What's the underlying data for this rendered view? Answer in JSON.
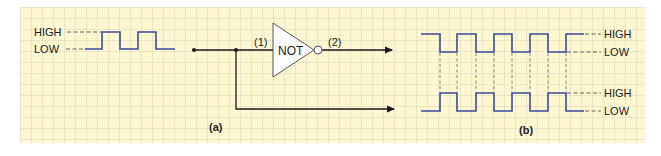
{
  "figure": {
    "colors": {
      "paper": "#fdf8d2",
      "grid": "#c9c6b4",
      "wave": "#3c4a9a",
      "wire": "#1a1a1a",
      "text": "#222222"
    },
    "grid": {
      "x0": 20,
      "y0": 7,
      "x1": 645,
      "y1": 143,
      "step": 11
    }
  },
  "panel_a": {
    "caption": "(a)",
    "input_wave": {
      "high_label": "HIGH",
      "low_label": "LOW",
      "description": "Two-pulse input waveform"
    },
    "gate": {
      "name": "NOT",
      "input_pin": "(1)",
      "output_pin": "(2)"
    }
  },
  "panel_b": {
    "caption": "(b)",
    "top_wave": {
      "high_label": "HIGH",
      "low_label": "LOW",
      "description": "Output waveform (inverted)"
    },
    "bottom_wave": {
      "high_label": "HIGH",
      "low_label": "LOW",
      "description": "Input waveform"
    }
  }
}
